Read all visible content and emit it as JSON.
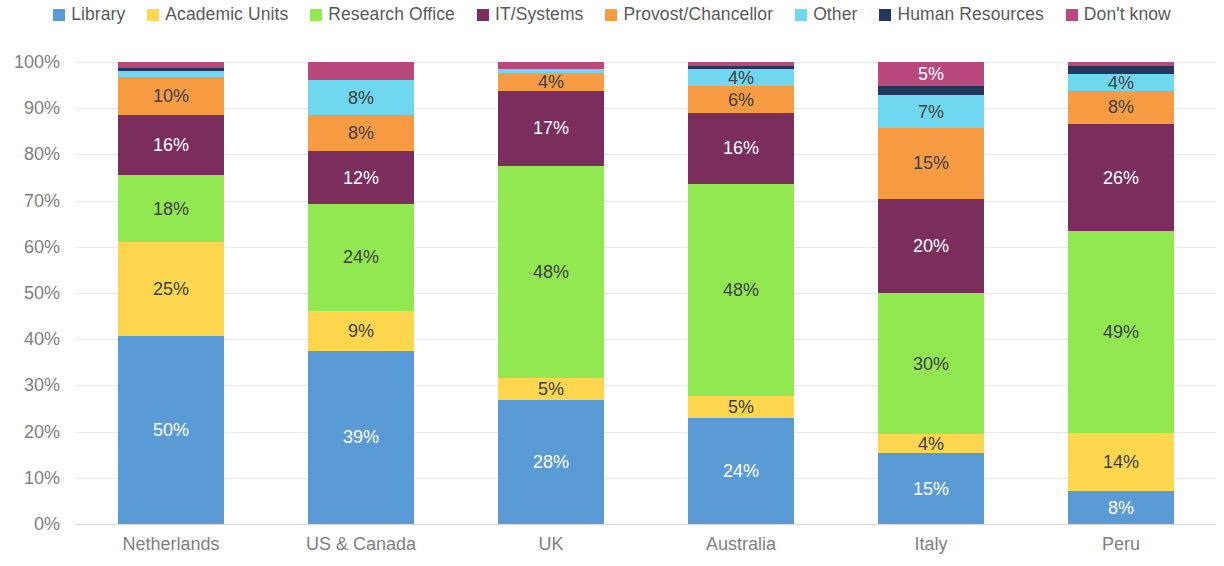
{
  "chart_data": {
    "type": "bar",
    "subtype": "stacked-100-percent",
    "title": "",
    "subtitle": "",
    "xlabel": "",
    "ylabel": "",
    "ylim": [
      0,
      100
    ],
    "grid": true,
    "legend_position": "top",
    "y_ticks": [
      "0%",
      "10%",
      "20%",
      "30%",
      "40%",
      "50%",
      "60%",
      "70%",
      "80%",
      "90%",
      "100%"
    ],
    "y_tick_values": [
      0,
      10,
      20,
      30,
      40,
      50,
      60,
      70,
      80,
      90,
      100
    ],
    "categories": [
      "Netherlands",
      "US & Canada",
      "UK",
      "Australia",
      "Italy",
      "Peru"
    ],
    "series": [
      {
        "name": "Library",
        "color": "#5B9BD5",
        "label_color": "light",
        "values": [
          50,
          39,
          28,
          24,
          15,
          8
        ],
        "labels": [
          "50%",
          "39%",
          "28%",
          "24%",
          "15%",
          "8%"
        ]
      },
      {
        "name": "Academic Units",
        "color": "#FFD74E",
        "label_color": "dark",
        "values": [
          25,
          9,
          5,
          5,
          4,
          14
        ],
        "labels": [
          "25%",
          "9%",
          "5%",
          "5%",
          "4%",
          "14%"
        ]
      },
      {
        "name": "Research Office",
        "color": "#92E850",
        "label_color": "dark",
        "values": [
          18,
          24,
          48,
          48,
          30,
          49
        ],
        "labels": [
          "18%",
          "24%",
          "48%",
          "48%",
          "30%",
          "49%"
        ]
      },
      {
        "name": "IT/Systems",
        "color": "#7B2D5E",
        "label_color": "light",
        "values": [
          16,
          12,
          17,
          16,
          20,
          26
        ],
        "labels": [
          "16%",
          "12%",
          "17%",
          "16%",
          "20%",
          "26%"
        ]
      },
      {
        "name": "Provost/Chancellor",
        "color": "#F79C42",
        "label_color": "dark",
        "values": [
          10,
          8,
          4,
          6,
          15,
          8
        ],
        "labels": [
          "10%",
          "8%",
          "4%",
          "6%",
          "15%",
          "8%"
        ]
      },
      {
        "name": "Other",
        "color": "#6FD8F0",
        "label_color": "dark",
        "values": [
          1.5,
          8,
          1,
          4,
          7,
          4
        ],
        "labels": [
          "",
          "8%",
          "",
          "4%",
          "7%",
          "4%"
        ]
      },
      {
        "name": "Human Resources",
        "color": "#22365E",
        "label_color": "light",
        "values": [
          1,
          0,
          0,
          0.7,
          2,
          2
        ],
        "labels": [
          "",
          "",
          "",
          "",
          "",
          ""
        ]
      },
      {
        "name": "Don't know",
        "color": "#B9487C",
        "label_color": "light",
        "values": [
          1.5,
          4,
          1.5,
          0.8,
          5,
          1
        ],
        "labels": [
          "",
          "",
          "",
          "",
          "5%",
          ""
        ]
      }
    ]
  }
}
